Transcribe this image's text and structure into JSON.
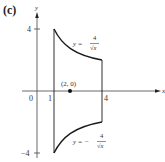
{
  "panel_label": "(c)",
  "axes": {
    "x_label": "x",
    "y_label": "y",
    "origin_label": "0",
    "x_ticks": [
      {
        "value": 1,
        "label": "1"
      },
      {
        "value": 4,
        "label": "4"
      }
    ],
    "y_ticks": [
      {
        "value": 4,
        "label": "4"
      },
      {
        "value": -4,
        "label": "−4"
      }
    ]
  },
  "curves": {
    "upper": {
      "equation_lhs": "y =",
      "numerator": "4",
      "denominator": "√x"
    },
    "lower": {
      "equation_lhs": "y = −",
      "numerator": "4",
      "denominator": "√x"
    }
  },
  "point": {
    "label": "(2, 0)",
    "x": 2,
    "y": 0
  },
  "region": {
    "x_min": 1,
    "x_max": 4
  },
  "colors": {
    "stroke": "#1a1a1a",
    "text": "#333333"
  }
}
